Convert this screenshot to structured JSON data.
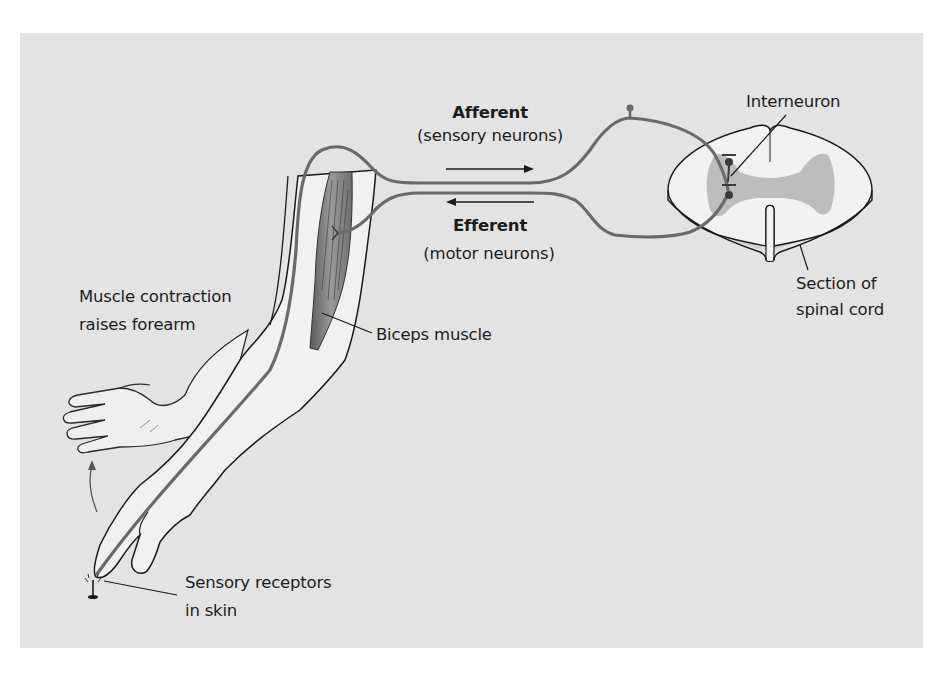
{
  "diagram": {
    "colors": {
      "background": "#e3e3e3",
      "page": "#ffffff",
      "nerve": "#6a6a6a",
      "outline": "#1a1a1a",
      "skin": "#f1f1f1",
      "gray_matter": "#bdbdbd",
      "muscle": "#8a8a8a"
    },
    "labels": {
      "afferent_title": "Afferent",
      "afferent_sub": "(sensory neurons)",
      "efferent_title": "Efferent",
      "efferent_sub": "(motor neurons)",
      "interneuron": "Interneuron",
      "spinal_line1": "Section of",
      "spinal_line2": "spinal cord",
      "muscle_line1": "Muscle contraction",
      "muscle_line2": "raises forearm",
      "biceps": "Biceps muscle",
      "receptor_line1": "Sensory receptors",
      "receptor_line2": "in skin"
    },
    "arrows": {
      "afferent_direction": "right",
      "efferent_direction": "left",
      "hand_motion": "up"
    }
  }
}
